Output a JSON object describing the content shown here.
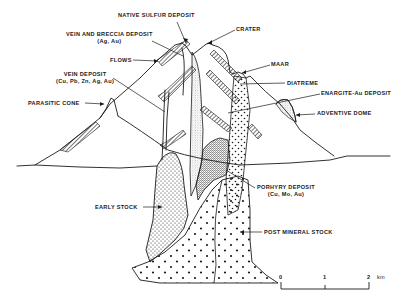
{
  "diagram": {
    "type": "geologic-cross-section",
    "line_color": "#1a1a1a",
    "background": "#ffffff"
  },
  "labels": {
    "native_sulfur": "NATIVE SULFUR DEPOSIT",
    "crater": "CRATER",
    "vein_breccia": "VEIN AND BRECCIA DEPOSIT",
    "vein_breccia_sub": "(Ag, Au)",
    "flows": "FLOWS",
    "maar": "MAAR",
    "vein_deposit": "VEIN DEPOSIT",
    "vein_deposit_sub": "(Cu, Pb, Zn, Ag, Au)",
    "diatreme": "DIATREME",
    "enargite": "ENARGITE-Au DEPOSIT",
    "parasitic_cone": "PARASITIC CONE",
    "adventive_dome": "ADVENTIVE DOME",
    "porphyry": "PORHYRY DEPOSIT",
    "porphyry_sub": "(Cu, Mo, Au)",
    "early_stock": "EARLY STOCK",
    "post_mineral_stock": "POST MINERAL STOCK"
  },
  "scale_bar": {
    "ticks": [
      "0",
      "1",
      "2"
    ],
    "unit": "km"
  }
}
